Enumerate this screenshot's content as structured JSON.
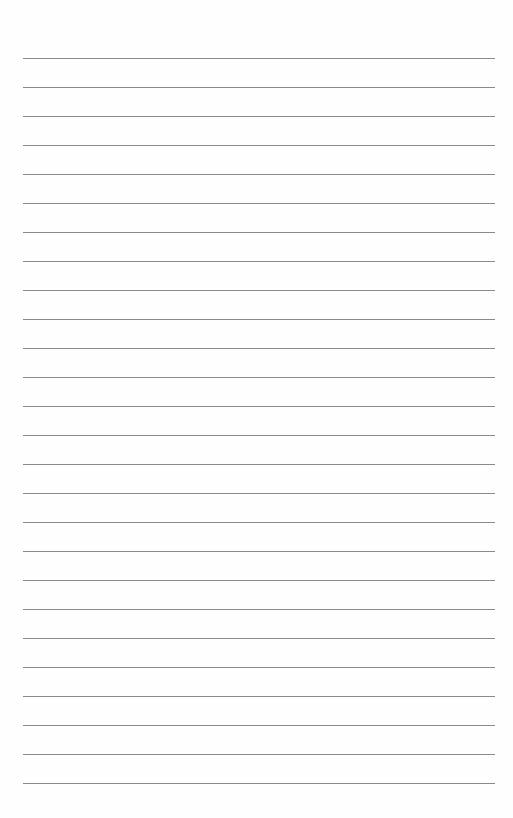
{
  "page": {
    "type": "lined-paper",
    "line_count": 26,
    "line_color": "#8a8a8a",
    "background_color": "#fefefe",
    "first_line_y": 58,
    "line_spacing": 29.0,
    "line_left": 23,
    "line_width": 472
  }
}
